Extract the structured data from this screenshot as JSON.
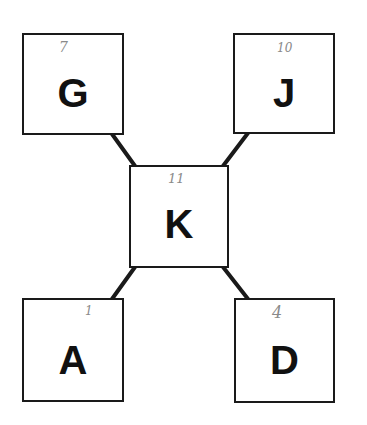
{
  "diagram": {
    "type": "node-link",
    "background": "#ffffff",
    "stroke_color": "#1a1a1a",
    "nodes": [
      {
        "id": "G",
        "label": "G",
        "note": "7",
        "position": "top-left"
      },
      {
        "id": "J",
        "label": "J",
        "note": "10",
        "position": "top-right"
      },
      {
        "id": "K",
        "label": "K",
        "note": "11",
        "position": "center"
      },
      {
        "id": "A",
        "label": "A",
        "note": "1",
        "position": "bottom-left"
      },
      {
        "id": "D",
        "label": "D",
        "note": "4",
        "position": "bottom-right"
      }
    ],
    "edges": [
      {
        "from": "G",
        "to": "K"
      },
      {
        "from": "J",
        "to": "K"
      },
      {
        "from": "K",
        "to": "A"
      },
      {
        "from": "K",
        "to": "D"
      }
    ]
  }
}
